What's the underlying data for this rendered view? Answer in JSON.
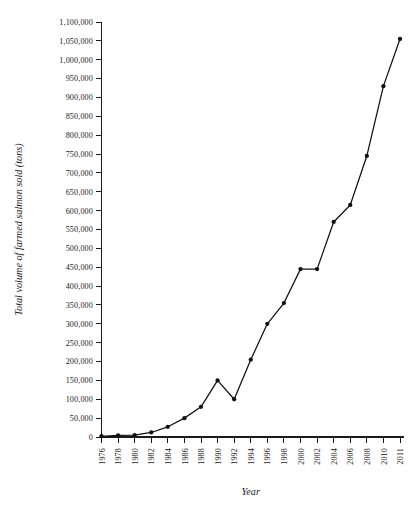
{
  "chart_data": {
    "type": "line",
    "title": "",
    "xlabel": "Year",
    "ylabel": "Total volume of farmed salmon sold (tons)",
    "xlim": [
      1976,
      2011
    ],
    "ylim": [
      0,
      1100000
    ],
    "grid": false,
    "legend": "none",
    "marker": "filled-circle",
    "line_color": "#111111",
    "x_tick_labels": [
      "1976",
      "1978",
      "1980",
      "1982",
      "1984",
      "1986",
      "1988",
      "1990",
      "1992",
      "1994",
      "1996",
      "1998",
      "2000",
      "2002",
      "2004",
      "2006",
      "2008",
      "2010",
      "2011"
    ],
    "y_tick_labels": [
      "0",
      "50,000",
      "100,000",
      "150,000",
      "200,000",
      "250,000",
      "300,000",
      "350,000",
      "400,000",
      "450,000",
      "500,000",
      "550,000",
      "600,000",
      "650,000",
      "700,000",
      "750,000",
      "800,000",
      "850,000",
      "900,000",
      "950,000",
      "1,000,000",
      "1,050,000",
      "1,100,000"
    ],
    "y_tick_values": [
      0,
      50000,
      100000,
      150000,
      200000,
      250000,
      300000,
      350000,
      400000,
      450000,
      500000,
      550000,
      600000,
      650000,
      700000,
      750000,
      800000,
      850000,
      900000,
      950000,
      1000000,
      1050000,
      1100000
    ],
    "x": [
      1976,
      1978,
      1980,
      1982,
      1984,
      1986,
      1988,
      1990,
      1992,
      1994,
      1996,
      1998,
      2000,
      2002,
      2004,
      2006,
      2008,
      2010,
      2011
    ],
    "values": [
      2000,
      4000,
      5000,
      12000,
      27000,
      50000,
      80000,
      150000,
      100000,
      205000,
      300000,
      355000,
      445000,
      445000,
      570000,
      615000,
      745000,
      930000,
      1055000
    ],
    "series": [
      {
        "name": "Total volume of farmed salmon sold (tons)",
        "values": [
          2000,
          4000,
          5000,
          12000,
          27000,
          50000,
          80000,
          150000,
          100000,
          205000,
          300000,
          355000,
          445000,
          445000,
          570000,
          615000,
          745000,
          930000,
          1055000
        ]
      }
    ]
  }
}
